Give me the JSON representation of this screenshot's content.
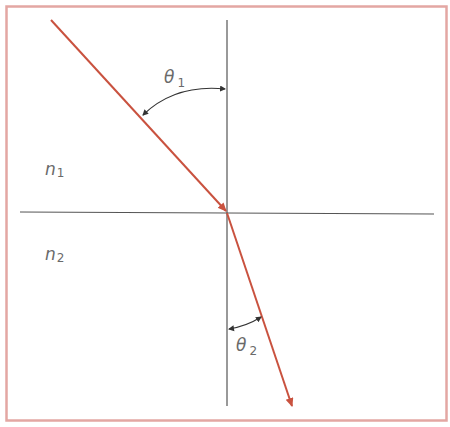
{
  "diagram": {
    "colors": {
      "frame": "#e3a7a3",
      "ray": "#c9523f",
      "lines": "#555555",
      "text": "#6a6a6a",
      "background": "#ffffff"
    },
    "media": [
      {
        "symbol": "n",
        "subscript": "1",
        "region": "upper"
      },
      {
        "symbol": "n",
        "subscript": "2",
        "region": "lower"
      }
    ],
    "angles": [
      {
        "symbol": "θ",
        "subscript": "1",
        "name": "angle of incidence"
      },
      {
        "symbol": "θ",
        "subscript": "2",
        "name": "angle of refraction"
      }
    ],
    "rays": [
      {
        "name": "incident-ray",
        "from": [
          51,
          20
        ],
        "to": [
          227,
          212
        ]
      },
      {
        "name": "refracted-ray",
        "from": [
          227,
          212
        ],
        "to": [
          292,
          407
        ]
      }
    ],
    "lines": [
      {
        "name": "normal-line",
        "from": [
          227,
          20
        ],
        "to": [
          227,
          406
        ]
      },
      {
        "name": "interface-line",
        "from": [
          20,
          212
        ],
        "to": [
          434,
          214
        ]
      }
    ]
  }
}
